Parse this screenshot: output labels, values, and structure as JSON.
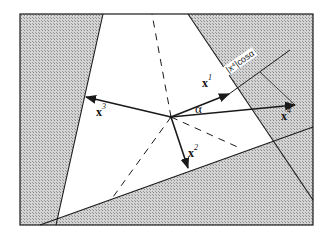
{
  "diagram": {
    "colors": {
      "line": "#1a1a1a",
      "shade": "#bdbdbd",
      "background": "#ffffff"
    },
    "frame": {
      "x1": 20,
      "y1": 14,
      "x2": 313,
      "y2": 225
    },
    "center": {
      "x": 171,
      "y": 117
    },
    "vectors": [
      {
        "id": "x1",
        "label": "x",
        "superscript": "1",
        "to": {
          "x": 229,
          "y": 94
        }
      },
      {
        "id": "x2",
        "label": "x",
        "superscript": "2",
        "to": {
          "x": 188,
          "y": 168
        }
      },
      {
        "id": "x3",
        "label": "x",
        "superscript": "3",
        "to": {
          "x": 86,
          "y": 97
        }
      },
      {
        "id": "x4",
        "label": "x",
        "superscript": "4",
        "to": {
          "x": 295,
          "y": 105
        }
      }
    ],
    "angle_label": "α",
    "projection_label": "|x⁴|cosα",
    "boundary_lines": [
      {
        "from": {
          "x": 103,
          "y": 14
        },
        "to": {
          "x": 56,
          "y": 225
        }
      },
      {
        "from": {
          "x": 188,
          "y": 14
        },
        "to": {
          "x": 313,
          "y": 200
        }
      },
      {
        "from": {
          "x": 40,
          "y": 225
        },
        "to": {
          "x": 313,
          "y": 127
        }
      }
    ],
    "dashed_lines": [
      {
        "to": {
          "x": 152,
          "y": 14
        }
      },
      {
        "to": {
          "x": 113,
          "y": 197
        }
      },
      {
        "to": {
          "x": 242,
          "y": 149
        }
      }
    ]
  }
}
